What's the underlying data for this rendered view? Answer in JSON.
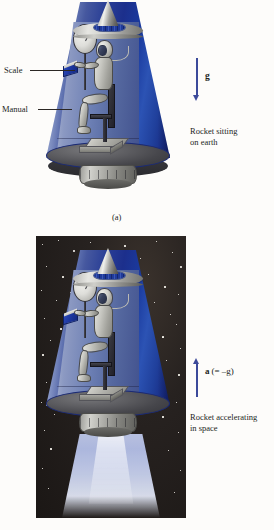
{
  "figure": {
    "title_caption_a": "(a)",
    "panel_a": {
      "labels": {
        "scale": "Scale",
        "manual": "Manual"
      },
      "vector": {
        "symbol": "g",
        "direction": "down"
      },
      "description_line1": "Rocket sitting",
      "description_line2": "on earth",
      "caption": "(a)"
    },
    "panel_b": {
      "vector": {
        "symbol": "a",
        "qualifier": "(= –g)",
        "direction": "up"
      },
      "description_line1": "Rocket accelerating",
      "description_line2": "in space"
    },
    "colors": {
      "hull_blue_dark": "#1a3a9e",
      "hull_blue_light": "#8d9cc4",
      "arrow_blue": "#3c4a9a",
      "space_background": "#1e1a18",
      "page_background": "#fdfcfa",
      "text": "#231f1c",
      "metal_gray": "#b0b0ab",
      "manual_blue": "#1d37a0"
    },
    "objects": {
      "nose_cone": "nose-cone",
      "upper_deck": "upper-deck-disc",
      "collar_band": "collar-band",
      "cabin_floor": "cabin-floor",
      "engine_ring": "engine-ring",
      "scale_dial": "scale-dial",
      "manual_book": "manual-book",
      "astronaut": "astronaut",
      "chair": "chair",
      "pedestal": "pedestal",
      "air_hose": "air-hose",
      "exhaust_plume": "exhaust-plume",
      "starfield": "starfield"
    }
  }
}
